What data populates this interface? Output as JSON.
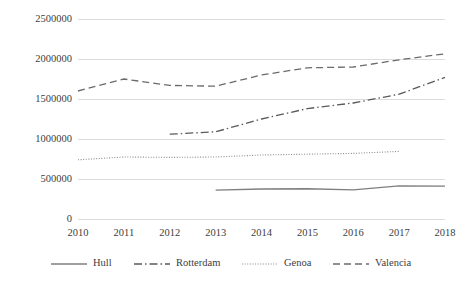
{
  "chart_data": {
    "type": "line",
    "title": "",
    "subtitle": "",
    "xlabel": "",
    "ylabel": "",
    "categories": [
      "2010",
      "2011",
      "2012",
      "2013",
      "2014",
      "2015",
      "2016",
      "2017",
      "2018"
    ],
    "x": [
      2010,
      2011,
      2012,
      2013,
      2014,
      2015,
      2016,
      2017,
      2018
    ],
    "ylim": [
      0,
      2500000
    ],
    "xlim": [
      2010,
      2018
    ],
    "y_ticks": [
      0,
      500000,
      1000000,
      1500000,
      2000000,
      2500000
    ],
    "y_tick_labels": [
      "0",
      "500000",
      "1000000",
      "1500000",
      "2000000",
      "2500000"
    ],
    "grid": "horizontal",
    "legend_position": "bottom",
    "series": [
      {
        "name": "Hull",
        "style": "solid",
        "color": "#7f7f7f",
        "x": [
          2013,
          2014,
          2015,
          2016,
          2017,
          2018
        ],
        "values": [
          360000,
          375000,
          378000,
          365000,
          415000,
          412000
        ]
      },
      {
        "name": "Rotterdam",
        "style": "dashdot",
        "color": "#5a5a5a",
        "x": [
          2012,
          2013,
          2014,
          2015,
          2016,
          2017,
          2018
        ],
        "values": [
          1060000,
          1090000,
          1250000,
          1380000,
          1450000,
          1560000,
          1770000
        ]
      },
      {
        "name": "Genoa",
        "style": "dotted",
        "color": "#8a8a8a",
        "x": [
          2010,
          2011,
          2012,
          2013,
          2014,
          2015,
          2016,
          2017
        ],
        "values": [
          740000,
          775000,
          770000,
          775000,
          800000,
          810000,
          820000,
          845000
        ]
      },
      {
        "name": "Valencia",
        "style": "dashed",
        "color": "#6b6b6b",
        "x": [
          2010,
          2011,
          2012,
          2013,
          2014,
          2015,
          2016,
          2017,
          2018
        ],
        "values": [
          1600000,
          1750000,
          1670000,
          1660000,
          1800000,
          1890000,
          1900000,
          1990000,
          2065000
        ]
      }
    ]
  },
  "axis": {
    "y_labels": [
      "2500000",
      "2000000",
      "1500000",
      "1000000",
      "500000",
      "0"
    ],
    "x_labels": [
      "2010",
      "2011",
      "2012",
      "2013",
      "2014",
      "2015",
      "2016",
      "2017",
      "2018"
    ]
  },
  "legend": {
    "items": [
      {
        "label": "Hull",
        "style": "solid"
      },
      {
        "label": "Rotterdam",
        "style": "dashdot"
      },
      {
        "label": "Genoa",
        "style": "dotted"
      },
      {
        "label": "Valencia",
        "style": "dashed"
      }
    ]
  },
  "colors": {
    "grid": "#dcdcdc",
    "axis": "#d0d0d0",
    "text": "#404040",
    "line_hull": "#7f7f7f",
    "line_rotterdam": "#5a5a5a",
    "line_genoa": "#8a8a8a",
    "line_valencia": "#6b6b6b"
  }
}
